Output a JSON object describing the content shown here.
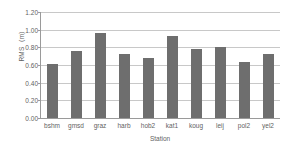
{
  "chart_data": {
    "type": "bar",
    "title": "",
    "xlabel": "Station",
    "ylabel": "RMS（m）",
    "categories": [
      "bshm",
      "gmsd",
      "graz",
      "harb",
      "hob2",
      "kat1",
      "koug",
      "leij",
      "pol2",
      "yel2"
    ],
    "values": [
      0.61,
      0.76,
      0.96,
      0.73,
      0.68,
      0.93,
      0.78,
      0.8,
      0.63,
      0.72
    ],
    "series": [
      {
        "name": "RMS",
        "values": [
          0.61,
          0.76,
          0.96,
          0.73,
          0.68,
          0.93,
          0.78,
          0.8,
          0.63,
          0.72
        ]
      }
    ],
    "ylim": [
      0.0,
      1.2
    ],
    "ytick_values": [
      0.0,
      0.2,
      0.4,
      0.6,
      0.8,
      1.0,
      1.2
    ],
    "ytick_labels": [
      "0.00",
      "0.20",
      "0.40",
      "0.60",
      "0.80",
      "1.00",
      "1.20"
    ],
    "grid": true,
    "grid_axis": "y",
    "legend": false,
    "legend_position": "none",
    "bar_color": "#6e6e6e",
    "gridline_color": "#c8c8c8",
    "axis_color": "#9a9a9a",
    "text_color": "#5f5f5f",
    "background": "#ffffff"
  }
}
